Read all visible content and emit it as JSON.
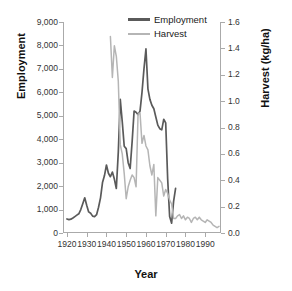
{
  "chart_data": {
    "type": "line",
    "title": "",
    "xlabel": "Year",
    "ylabel": "Employment",
    "y2label": "Harvest (kg/ha)",
    "xlim": [
      1918,
      1998
    ],
    "ylim": [
      0,
      9000
    ],
    "y2lim": [
      0.0,
      1.6
    ],
    "grid": false,
    "legend_position": "top-center",
    "x_ticks": [
      "1920",
      "1930",
      "1940",
      "1950",
      "1960",
      "1970",
      "1980",
      "1990"
    ],
    "x_tick_values": [
      1920,
      1930,
      1940,
      1950,
      1960,
      1970,
      1980,
      1990
    ],
    "y_ticks": [
      "0",
      "1,000",
      "2,000",
      "3,000",
      "4,000",
      "5,000",
      "6,000",
      "7,000",
      "8,000",
      "9,000"
    ],
    "y_tick_values": [
      0,
      1000,
      2000,
      3000,
      4000,
      5000,
      6000,
      7000,
      8000,
      9000
    ],
    "y2_ticks": [
      "0.0",
      "0.2",
      "0.4",
      "0.6",
      "0.8",
      "1.0",
      "1.2",
      "1.4",
      "1.6"
    ],
    "y2_tick_values": [
      0.0,
      0.2,
      0.4,
      0.6,
      0.8,
      1.0,
      1.2,
      1.4,
      1.6
    ],
    "colors": {
      "employment": "#5a5a5a",
      "harvest": "#b5b5b5",
      "axis": "#aaaaaa",
      "text": "#1a1a1a"
    },
    "series": [
      {
        "name": "Employment",
        "axis": "left",
        "color": "#5a5a5a",
        "x": [
          1920,
          1921,
          1922,
          1923,
          1924,
          1925,
          1926,
          1927,
          1928,
          1929,
          1930,
          1931,
          1932,
          1933,
          1934,
          1935,
          1936,
          1937,
          1938,
          1939,
          1940,
          1941,
          1942,
          1943,
          1944,
          1945,
          1946,
          1947,
          1948,
          1949,
          1950,
          1951,
          1952,
          1953,
          1954,
          1955,
          1956,
          1957,
          1958,
          1959,
          1960,
          1961,
          1962,
          1963,
          1964,
          1965,
          1966,
          1967,
          1968,
          1969,
          1970,
          1971,
          1972,
          1973,
          1974,
          1975
        ],
        "values": [
          600,
          570,
          590,
          640,
          700,
          760,
          820,
          1000,
          1250,
          1500,
          1180,
          900,
          840,
          720,
          700,
          780,
          1100,
          1500,
          2150,
          2450,
          2900,
          2550,
          2400,
          2600,
          2300,
          1900,
          3450,
          5700,
          4750,
          3700,
          3600,
          3000,
          2750,
          3900,
          5200,
          5150,
          5050,
          5200,
          6000,
          7000,
          7850,
          6150,
          5700,
          5450,
          5300,
          4950,
          4600,
          4450,
          4400,
          4850,
          4700,
          2300,
          700,
          420,
          1350,
          1900
        ]
      },
      {
        "name": "Harvest",
        "axis": "right",
        "color": "#b5b5b5",
        "x": [
          1942,
          1943,
          1944,
          1945,
          1946,
          1947,
          1948,
          1949,
          1950,
          1951,
          1952,
          1953,
          1954,
          1955,
          1956,
          1957,
          1958,
          1959,
          1960,
          1961,
          1962,
          1963,
          1964,
          1965,
          1966,
          1967,
          1968,
          1969,
          1970,
          1971,
          1972,
          1973,
          1974,
          1975,
          1976,
          1977,
          1978,
          1979,
          1980,
          1981,
          1982,
          1983,
          1984,
          1985,
          1986,
          1987,
          1988,
          1989,
          1990,
          1991,
          1992,
          1993,
          1994,
          1995,
          1996,
          1997
        ],
        "values": [
          1.49,
          1.18,
          1.42,
          1.34,
          1.15,
          0.67,
          0.6,
          0.45,
          0.26,
          0.35,
          0.4,
          0.44,
          0.42,
          0.35,
          0.9,
          0.91,
          0.68,
          0.74,
          0.66,
          0.63,
          0.51,
          0.44,
          0.52,
          0.13,
          0.42,
          0.4,
          0.38,
          0.28,
          0.33,
          0.3,
          0.25,
          0.22,
          0.11,
          0.11,
          0.13,
          0.14,
          0.11,
          0.13,
          0.1,
          0.12,
          0.11,
          0.08,
          0.11,
          0.12,
          0.1,
          0.12,
          0.1,
          0.09,
          0.08,
          0.1,
          0.09,
          0.08,
          0.06,
          0.05,
          0.04,
          0.05
        ]
      }
    ],
    "legend": [
      {
        "label": "Employment",
        "color": "#5a5a5a"
      },
      {
        "label": "Harvest",
        "color": "#b5b5b5"
      }
    ]
  }
}
